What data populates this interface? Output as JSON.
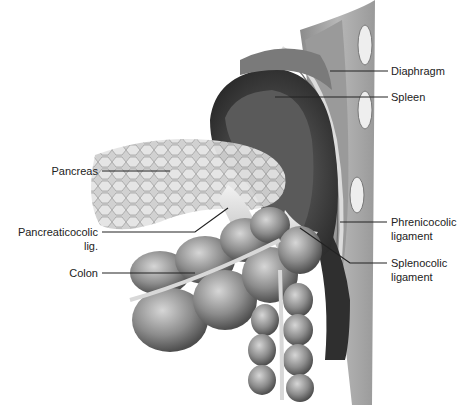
{
  "figure": {
    "labels": {
      "diaphragm": "Diaphragm",
      "spleen": "Spleen",
      "pancreas": "Pancreas",
      "pancreaticocolic_1": "Pancreaticocolic",
      "pancreaticocolic_2": "lig.",
      "colon": "Colon",
      "phrenicocolic_1": "Phrenicocolic",
      "phrenicocolic_2": "ligament",
      "splenocolic_1": "Splenocolic",
      "splenocolic_2": "ligament"
    },
    "colors": {
      "ink": "#222222",
      "organ_dark": "#4a4a4a",
      "organ_mid": "#8a8a8a",
      "organ_light": "#c8c8c8"
    }
  }
}
